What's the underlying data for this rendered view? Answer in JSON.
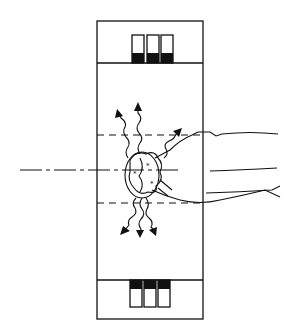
{
  "diagram": {
    "description": "Schematic of a head positioned within a rectangular imaging chamber with detector arrays at top and bottom; wavy arrows radiate outward from the head",
    "colors": {
      "ink": "#111111",
      "background": "#ffffff"
    },
    "frame": {
      "x": 97,
      "y": 21,
      "width": 106,
      "height": 298
    },
    "top_band_y": 63,
    "bottom_band_y": 280,
    "dashed_lines_y": [
      135,
      203
    ],
    "axis_line_y": 170,
    "top_detectors": {
      "count": 3,
      "fill": "bottom-half"
    },
    "bottom_detectors": {
      "count": 3,
      "fill": "top-half"
    },
    "radiation_arrows": {
      "upward": 3,
      "downward": 3
    }
  }
}
